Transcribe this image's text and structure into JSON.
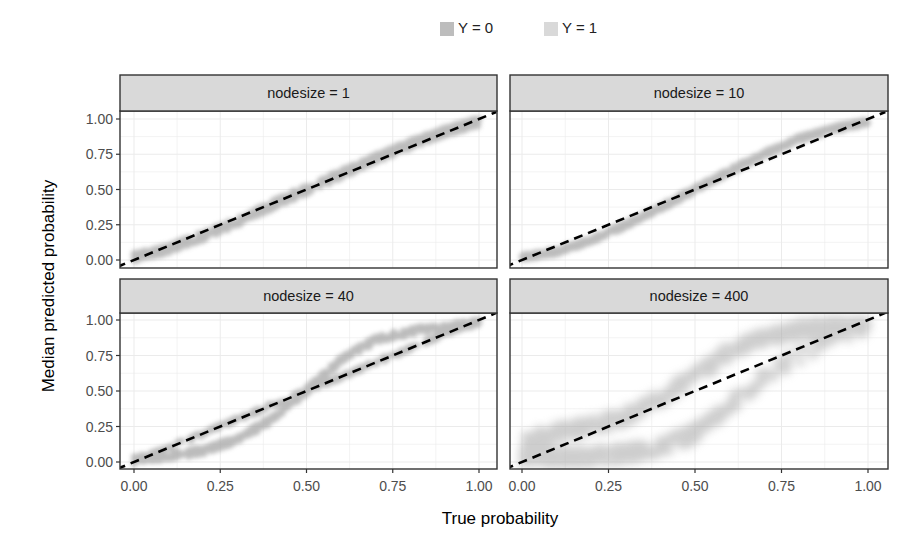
{
  "legend": {
    "items": [
      {
        "label": "Y = 0",
        "color": "#bdbdbd"
      },
      {
        "label": "Y = 1",
        "color": "#d9d9d9"
      }
    ]
  },
  "axes": {
    "xlabel": "True probability",
    "ylabel": "Median predicted probability",
    "xticks": [
      "0.00",
      "0.25",
      "0.50",
      "0.75",
      "1.00"
    ],
    "yticks": [
      "0.00",
      "0.25",
      "0.50",
      "0.75",
      "1.00"
    ]
  },
  "panels": [
    {
      "strip": "nodesize = 1"
    },
    {
      "strip": "nodesize = 10"
    },
    {
      "strip": "nodesize = 40"
    },
    {
      "strip": "nodesize = 400"
    }
  ],
  "colors": {
    "strip_bg": "#d9d9d9",
    "panel_border": "#333333",
    "grid": "#ebebeb",
    "points": "#a6a6a6",
    "reference_line": "#000000"
  },
  "chart_data": {
    "type": "scatter",
    "title": "",
    "xlabel": "True probability",
    "ylabel": "Median predicted probability",
    "xlim": [
      0,
      1
    ],
    "ylim": [
      0,
      1
    ],
    "grid": true,
    "legend_position": "top",
    "legend": [
      "Y = 0",
      "Y = 1"
    ],
    "facets": [
      "nodesize = 1",
      "nodesize = 10",
      "nodesize = 40",
      "nodesize = 400"
    ],
    "reference_line": {
      "type": "dashed",
      "x": [
        0,
        1
      ],
      "y": [
        0,
        1
      ]
    },
    "series": [
      {
        "facet": "nodesize = 1",
        "description": "points lie tightly around the identity line",
        "x": [
          0.0,
          0.1,
          0.2,
          0.3,
          0.4,
          0.5,
          0.6,
          0.7,
          0.8,
          0.9,
          1.0
        ],
        "y": [
          0.02,
          0.08,
          0.17,
          0.27,
          0.39,
          0.5,
          0.61,
          0.72,
          0.82,
          0.91,
          0.98
        ]
      },
      {
        "facet": "nodesize = 10",
        "description": "slight S-shape, close to identity",
        "x": [
          0.0,
          0.1,
          0.2,
          0.3,
          0.4,
          0.5,
          0.6,
          0.7,
          0.8,
          0.9,
          1.0
        ],
        "y": [
          0.02,
          0.06,
          0.14,
          0.25,
          0.37,
          0.5,
          0.63,
          0.75,
          0.86,
          0.93,
          0.98
        ]
      },
      {
        "facet": "nodesize = 40",
        "description": "pronounced S-shape: under-predicts below 0.5, over-predicts above 0.5",
        "x": [
          0.0,
          0.1,
          0.2,
          0.3,
          0.4,
          0.5,
          0.6,
          0.7,
          0.8,
          0.9,
          1.0
        ],
        "y": [
          0.02,
          0.04,
          0.08,
          0.16,
          0.3,
          0.5,
          0.72,
          0.86,
          0.92,
          0.95,
          0.98
        ]
      },
      {
        "facet": "nodesize = 400",
        "description": "widely dispersed two-band cloud; low predictions for small/mid true probs, high for large",
        "x": [
          0.0,
          0.1,
          0.2,
          0.3,
          0.4,
          0.5,
          0.6,
          0.7,
          0.8,
          0.9,
          1.0
        ],
        "y_upper": [
          0.15,
          0.2,
          0.25,
          0.32,
          0.45,
          0.6,
          0.78,
          0.88,
          0.93,
          0.96,
          0.98
        ],
        "y_lower": [
          0.03,
          0.03,
          0.04,
          0.06,
          0.1,
          0.2,
          0.4,
          0.6,
          0.75,
          0.88,
          0.95
        ]
      }
    ]
  }
}
